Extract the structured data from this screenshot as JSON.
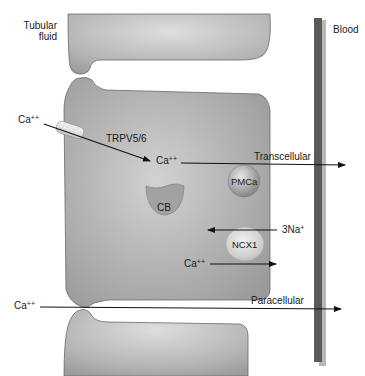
{
  "diagram": {
    "compartments": {
      "lumen": "Tubular\nfluid",
      "lumen_line1": "Tubular",
      "lumen_line2": "fluid",
      "blood": "Blood"
    },
    "ions": {
      "ca_lumen": "Ca",
      "ca_lumen_charge": "++",
      "ca_cell": "Ca",
      "ca_cell_charge": "++",
      "na": "3Na",
      "na_charge": "+",
      "ca_ncx": "Ca",
      "ca_ncx_charge": "++",
      "ca_para": "Ca",
      "ca_para_charge": "++"
    },
    "transporters": {
      "channel": "TRPV5/6",
      "pump": "PMCa",
      "exchanger": "NCX1",
      "binding_protein": "CB"
    },
    "pathways": {
      "transcellular": "Transcellular",
      "paracellular": "Paracellular"
    },
    "colors": {
      "cell_fill": "#a9a9a9",
      "cell_highlight": "#d4d4d4",
      "cell_outline": "#6a6a6a",
      "basement_membrane": "#5a5a5a",
      "membrane_shadow": "#b8b8b8",
      "arrow": "#111111"
    }
  }
}
